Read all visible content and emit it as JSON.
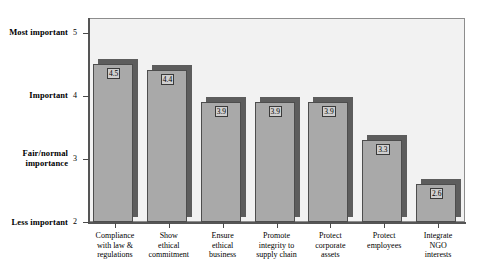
{
  "chart_data": {
    "type": "bar",
    "title": "",
    "xlabel": "",
    "ylabel": "",
    "ylim": [
      2,
      5
    ],
    "grid": false,
    "legend": "none",
    "categories": [
      "Compliance with law & regulations",
      "Show ethical commitment",
      "Ensure ethical business",
      "Promote integrity to supply chain",
      "Protect corporate assets",
      "Protect employees",
      "Integrate NGO interests"
    ],
    "category_lines": [
      [
        "Compliance",
        "with law &",
        "regulations"
      ],
      [
        "Show",
        "ethical",
        "commitment"
      ],
      [
        "Ensure",
        "ethical",
        "business"
      ],
      [
        "Promote",
        "integrity to",
        "supply chain"
      ],
      [
        "Protect",
        "corporate",
        "assets"
      ],
      [
        "Protect",
        "employees"
      ],
      [
        "Integrate",
        "NGO",
        "interests"
      ]
    ],
    "values": [
      4.5,
      4.4,
      3.9,
      3.9,
      3.9,
      3.3,
      2.6
    ],
    "value_labels": [
      "4.5",
      "4.4",
      "3.9",
      "3.9",
      "3.9",
      "3.3",
      "2.6"
    ],
    "y_ticks": [
      {
        "value": 5,
        "number": "5",
        "lines": [
          "Most important"
        ]
      },
      {
        "value": 4,
        "number": "4",
        "lines": [
          "Important"
        ]
      },
      {
        "value": 3,
        "number": "3",
        "lines": [
          "Fair/normal",
          "importance"
        ]
      },
      {
        "value": 2,
        "number": "2",
        "lines": [
          "Less important"
        ]
      }
    ]
  },
  "colors": {
    "bar_face": "#a9a9a9",
    "bar_shadow": "#5d5d5d",
    "bar_border": "#4d4d4d",
    "plot_background": "#f2f2f2",
    "axis": "#555555",
    "value_box": "#cfcfcf",
    "text": "#000000"
  }
}
